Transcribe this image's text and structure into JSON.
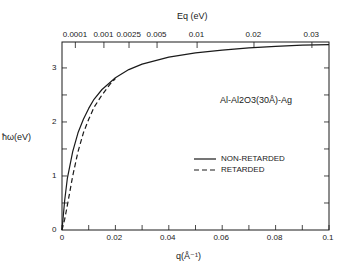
{
  "chart_data": {
    "type": "line",
    "title": "",
    "xlabel": "q(Å⁻¹)",
    "ylabel": "ħω(eV)",
    "top_xlabel": "Eq (eV)",
    "xlim": [
      0,
      0.1
    ],
    "ylim": [
      0,
      3.48
    ],
    "x_ticks": [
      0,
      0.02,
      0.04,
      0.06,
      0.08,
      0.1
    ],
    "x_tick_labels": [
      "0",
      "0.02",
      "0.04",
      "0.06",
      "0.08",
      "0.1"
    ],
    "y_ticks": [
      0,
      1,
      2,
      3
    ],
    "y_tick_labels": [
      "0",
      "1",
      "2",
      "3"
    ],
    "top_ticks": [
      {
        "label": "0.0001",
        "q": 0.005
      },
      {
        "label": "0.001",
        "q": 0.0157
      },
      {
        "label": "0.0025",
        "q": 0.0251
      },
      {
        "label": "0.005",
        "q": 0.0356
      },
      {
        "label": "0.01",
        "q": 0.0506
      },
      {
        "label": "0.02",
        "q": 0.0719
      },
      {
        "label": "0.03",
        "q": 0.0936
      }
    ],
    "annotation": "Al-Al2O3(30Å)-Ag",
    "legend_position": "right-center",
    "grid": false,
    "series": [
      {
        "name": "NON-RETARDED",
        "style": "solid",
        "x": [
          0,
          0.001,
          0.002,
          0.004,
          0.006,
          0.008,
          0.01,
          0.012,
          0.015,
          0.02,
          0.025,
          0.03,
          0.04,
          0.05,
          0.06,
          0.07,
          0.08,
          0.09,
          0.1
        ],
        "values": [
          0,
          0.55,
          0.95,
          1.45,
          1.8,
          2.05,
          2.25,
          2.42,
          2.6,
          2.82,
          2.97,
          3.07,
          3.2,
          3.28,
          3.33,
          3.37,
          3.4,
          3.42,
          3.43
        ]
      },
      {
        "name": "RETARDED",
        "style": "dashed",
        "x": [
          0,
          0.001,
          0.002,
          0.004,
          0.006,
          0.008,
          0.01,
          0.012,
          0.015,
          0.018,
          0.02
        ],
        "values": [
          0,
          0.2,
          0.45,
          1.0,
          1.45,
          1.8,
          2.05,
          2.27,
          2.5,
          2.7,
          2.8
        ]
      }
    ]
  }
}
